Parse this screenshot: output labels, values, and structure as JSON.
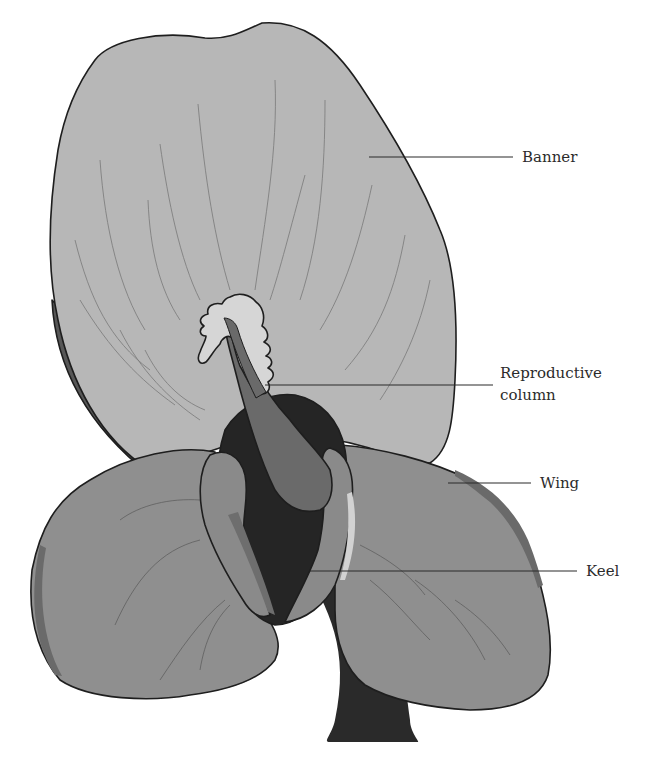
{
  "figure": {
    "colors": {
      "background": "#ffffff",
      "banner": "#b7b7b7",
      "banner_shadow": "#5a5a5a",
      "wing": "#8f8f8f",
      "keel": "#7c7c7c",
      "keel_interior": "#0e0e0e",
      "reproductive_column": "#6a6a6a",
      "stigma_crest": "#d6d6d6",
      "stem": "#2a2a2a",
      "outline": "#1e1e1e",
      "label_text": "#2b2b2b"
    }
  },
  "labels": [
    {
      "id": "banner",
      "text": "Banner"
    },
    {
      "id": "reproductive_column",
      "line1": "Reproductive",
      "line2": "column"
    },
    {
      "id": "wing",
      "text": "Wing"
    },
    {
      "id": "keel",
      "text": "Keel"
    }
  ]
}
